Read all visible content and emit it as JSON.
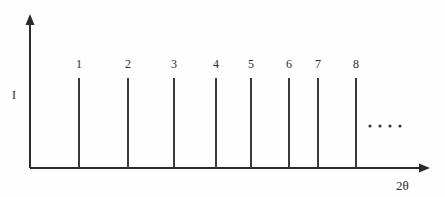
{
  "chart_data": {
    "type": "bar",
    "title": "",
    "subtitle": "",
    "xlabel": "2θ",
    "ylabel": "I",
    "categories": [
      "1",
      "2",
      "3",
      "4",
      "5",
      "6",
      "7",
      "8"
    ],
    "values": [
      1,
      1,
      1,
      1,
      1,
      1,
      1,
      1
    ],
    "data_labels": [
      "1",
      "2",
      "3",
      "4",
      "5",
      "6",
      "7",
      "8"
    ],
    "annotations": [
      "· · · ·"
    ],
    "grid": false,
    "legend": false,
    "legend_position": "none",
    "xlim": [
      0,
      1
    ],
    "ylim": [
      0,
      1
    ],
    "axis_ticks": {
      "x": [],
      "y": []
    },
    "axis_arrows": {
      "x": true,
      "y": true
    }
  },
  "axes": {
    "y_label": "I",
    "x_label": "2θ",
    "origin_x": 30,
    "origin_y": 168,
    "y_top": 20,
    "x_right": 424,
    "arrow_color": "#2b2b2b"
  },
  "peaks": [
    {
      "label": "1",
      "x": 79,
      "top": 78,
      "bottom": 168,
      "label_y": 58
    },
    {
      "label": "2",
      "x": 128,
      "top": 78,
      "bottom": 168,
      "label_y": 58
    },
    {
      "label": "3",
      "x": 174,
      "top": 78,
      "bottom": 168,
      "label_y": 58
    },
    {
      "label": "4",
      "x": 216,
      "top": 78,
      "bottom": 168,
      "label_y": 58
    },
    {
      "label": "5",
      "x": 251,
      "top": 78,
      "bottom": 168,
      "label_y": 58
    },
    {
      "label": "6",
      "x": 289,
      "top": 78,
      "bottom": 168,
      "label_y": 58
    },
    {
      "label": "7",
      "x": 318,
      "top": 78,
      "bottom": 168,
      "label_y": 58
    },
    {
      "label": "8",
      "x": 356,
      "top": 78,
      "bottom": 168,
      "label_y": 58
    }
  ],
  "ellipsis": {
    "dots": [
      370,
      380,
      390,
      400
    ],
    "y": 126,
    "radius": 1.6,
    "color": "#3a3a3a"
  },
  "colors": {
    "background": "#fefefe",
    "axis": "#2b2b2b",
    "peak": "#3a3a3a",
    "text": "#2b2b2b"
  }
}
